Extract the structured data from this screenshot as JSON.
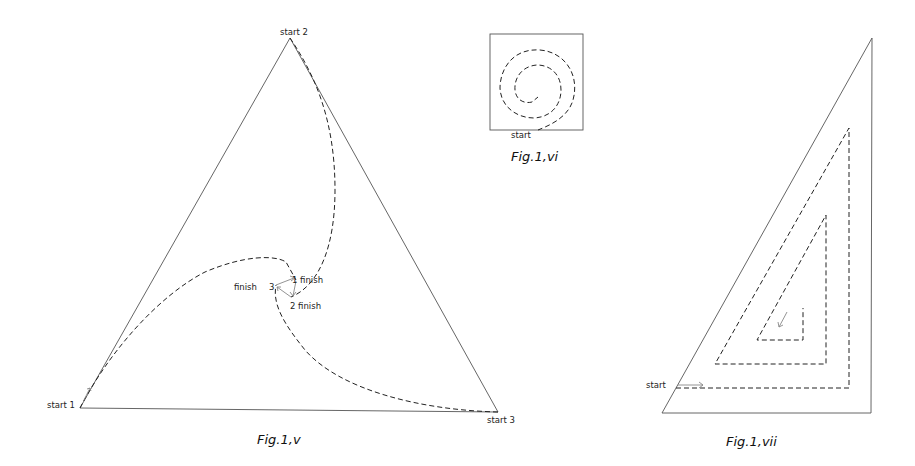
{
  "figures": [
    {
      "id": "fig-1-v",
      "caption": "Fig.1,v",
      "shape": "equilateral triangle",
      "labels": {
        "start1": "start 1",
        "start2": "start 2",
        "start3": "start 3",
        "finish1": "1 finish",
        "finish2": "2 finish",
        "finish3_num": "3",
        "finish3_word": "finish"
      },
      "paths": [
        "curved dashed path from start 1 to finish 1",
        "curved dashed path from start 2 to finish 2",
        "curved dashed path from start 3 to finish 3"
      ]
    },
    {
      "id": "fig-1-vi",
      "caption": "Fig.1,vi",
      "shape": "square",
      "labels": {
        "start": "start"
      },
      "paths": [
        "dashed spiral inward from start"
      ]
    },
    {
      "id": "fig-1-vii",
      "caption": "Fig.1,vii",
      "shape": "right triangle",
      "labels": {
        "start": "start"
      },
      "paths": [
        "dashed triangular spiral inward from start"
      ]
    }
  ]
}
